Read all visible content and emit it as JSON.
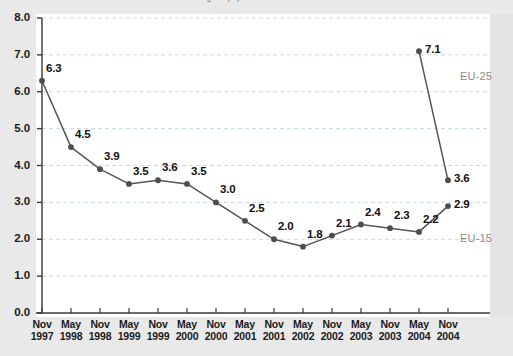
{
  "title_partial": "...ge of population 65 and over",
  "series_labels": {
    "eu25": "EU-25",
    "eu15": "EU-15"
  },
  "axis": {
    "y_ticks": [
      "8.0",
      "7.0",
      "6.0",
      "5.0",
      "4.0",
      "3.0",
      "2.0",
      "1.0",
      "0.0"
    ],
    "x_labels": [
      {
        "month": "Nov",
        "year": "1997"
      },
      {
        "month": "May",
        "year": "1998"
      },
      {
        "month": "Nov",
        "year": "1998"
      },
      {
        "month": "May",
        "year": "1999"
      },
      {
        "month": "Nov",
        "year": "1999"
      },
      {
        "month": "May",
        "year": "2000"
      },
      {
        "month": "Nov",
        "year": "2000"
      },
      {
        "month": "May",
        "year": "2001"
      },
      {
        "month": "Nov",
        "year": "2001"
      },
      {
        "month": "May",
        "year": "2002"
      },
      {
        "month": "Nov",
        "year": "2002"
      },
      {
        "month": "May",
        "year": "2003"
      },
      {
        "month": "Nov",
        "year": "2003"
      },
      {
        "month": "May",
        "year": "2004"
      },
      {
        "month": "Nov",
        "year": "2004"
      }
    ]
  },
  "colors": {
    "line": "#555555",
    "marker": "#4d4d4d",
    "grid": "#c9d6e8",
    "axis": "#3a3a3a",
    "series_label": "#8c8c8c",
    "plot_bg": "#ffffff",
    "page_bg": "#e9e9e9"
  },
  "chart_data": {
    "type": "line",
    "title": "...ge of population 65 and over",
    "xlabel": "",
    "ylabel": "",
    "ylim": [
      0,
      8
    ],
    "ytick_step": 1,
    "grid": true,
    "legend": "inline-right",
    "categories": [
      "Nov 1997",
      "May 1998",
      "Nov 1998",
      "May 1999",
      "Nov 1999",
      "May 2000",
      "Nov 2000",
      "May 2001",
      "Nov 2001",
      "May 2002",
      "Nov 2002",
      "May 2003",
      "Nov 2003",
      "May 2004",
      "Nov 2004"
    ],
    "series": [
      {
        "name": "EU-15",
        "values": [
          6.3,
          4.5,
          3.9,
          3.5,
          3.6,
          3.5,
          3.0,
          2.5,
          2.0,
          1.8,
          2.1,
          2.4,
          2.3,
          2.2,
          2.9
        ],
        "point_labels": [
          "6.3",
          "4.5",
          "3.9",
          "3.5",
          "3.6",
          "3.5",
          "3.0",
          "2.5",
          "2.0",
          "1.8",
          "2.1",
          "2.4",
          "2.3",
          "2.2",
          "2.9"
        ]
      },
      {
        "name": "EU-25",
        "x": [
          "May 2004",
          "Nov 2004"
        ],
        "values": [
          7.1,
          3.6
        ],
        "point_labels": [
          "7.1",
          "3.6"
        ]
      }
    ]
  },
  "geometry": {
    "x0": 42,
    "dx": 29,
    "y_zero": 313,
    "y_per_unit": 36.875
  }
}
